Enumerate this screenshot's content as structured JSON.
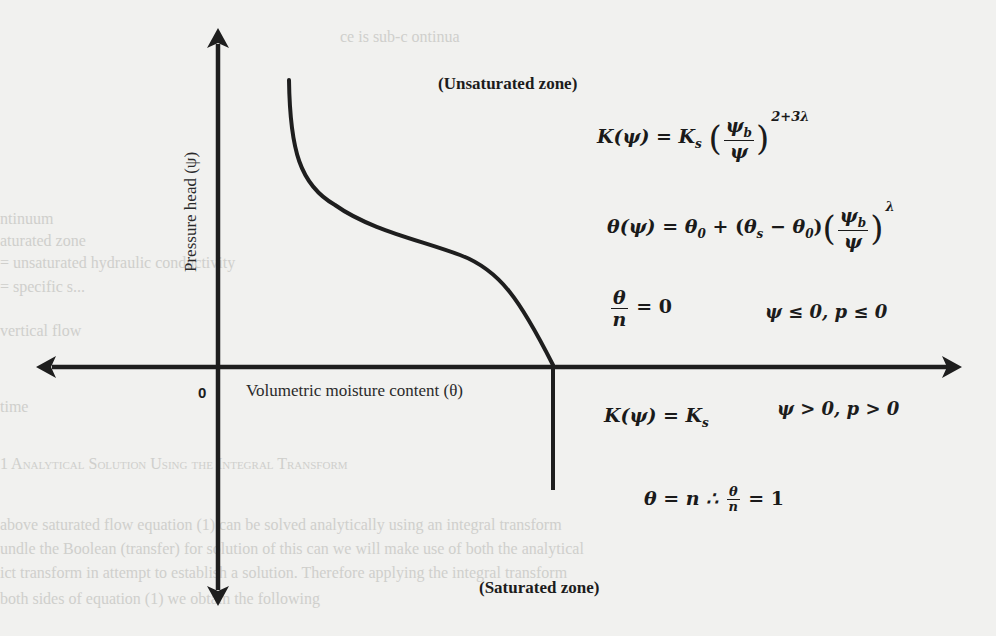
{
  "diagram": {
    "zones": {
      "unsaturated": "(Unsaturated zone)",
      "saturated": "(Saturated zone)"
    },
    "axes": {
      "y_label": "Pressure head (ψ)",
      "x_label": "Volumetric moisture content (θ)",
      "origin_label": "0"
    },
    "equations": {
      "unsaturated_conductivity": {
        "lhs": "K(ψ) =",
        "coef": "K",
        "coef_sub": "s",
        "num": "ψ",
        "num_sub": "b",
        "den": "ψ",
        "exponent": "2+3λ"
      },
      "unsaturated_moisture": {
        "lhs": "θ(ψ) =",
        "term1": "θ",
        "term1_sub": "0",
        "plus": "+",
        "diff_a": "θ",
        "diff_a_sub": "s",
        "minus": "−",
        "diff_b": "θ",
        "diff_b_sub": "0",
        "num": "ψ",
        "num_sub": "b",
        "den": "ψ",
        "exponent": "λ"
      },
      "unsaturated_ratio": {
        "num": "θ",
        "den": "n",
        "rhs": "= 0",
        "condition": "ψ ≤ 0, p ≤ 0"
      },
      "saturated_conductivity": {
        "lhs": "K(ψ) = K",
        "lhs_sub": "s",
        "condition": "ψ > 0, p > 0"
      },
      "saturated_moisture": {
        "lhs": "θ = n ∴",
        "num": "θ",
        "den": "n",
        "rhs": "= 1"
      }
    },
    "background_bleed_text": [
      "ce is sub-c ontinua",
      "ntinuum",
      "aturated zone",
      "= unsaturated hydraulic conductivity",
      "= specific s...",
      "vertical flow",
      "time",
      "1  Analytical Solution Using the Integral Transform",
      "above saturated flow equation (1) can be solved analytically using an integral transform",
      "undle the Boolean (transfer) for solution of this can we will make use of both the analytical",
      "ict transform in attempt to establish a solution. Therefore applying the integral transform",
      "both sides of equation (1) we obtain the following"
    ]
  }
}
